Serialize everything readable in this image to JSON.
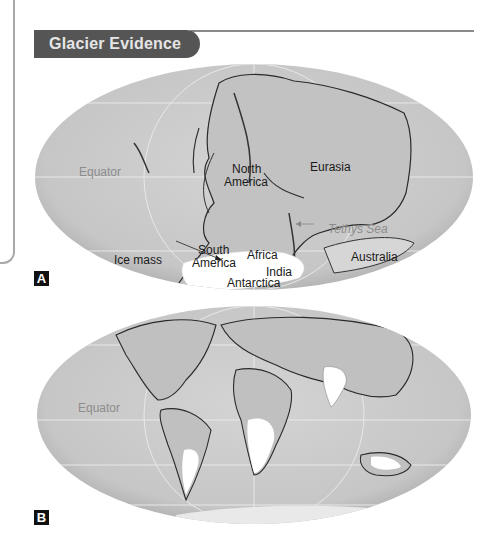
{
  "header": {
    "title": "Glacier Evidence"
  },
  "colors": {
    "header_bg": "#555555",
    "header_text": "#e6e6e6",
    "map_fill": "#c9c9c9",
    "land": "#bdbdbd",
    "ice": "#ffffff",
    "rule": "#8a8a8a"
  },
  "map_a": {
    "tag": "A",
    "labels": {
      "equator": "Equator",
      "north_america": "North\nAmerica",
      "north": "North",
      "america": "America",
      "eurasia": "Eurasia",
      "south": "South",
      "south_america_2": "America",
      "africa": "Africa",
      "tethys_sea": "Tethys Sea",
      "ice_mass": "Ice mass",
      "india": "India",
      "antarctica": "Antarctica",
      "australia": "Australia"
    }
  },
  "map_b": {
    "tag": "B",
    "labels": {
      "equator": "Equator"
    }
  }
}
